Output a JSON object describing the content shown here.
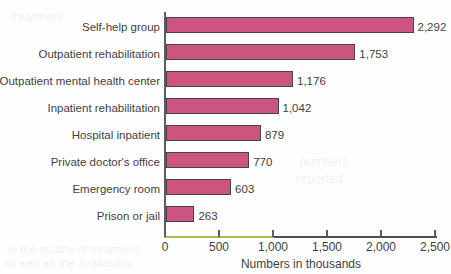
{
  "chart_data": {
    "type": "bar",
    "orientation": "horizontal",
    "title": "",
    "xlabel": "Numbers in thousands",
    "ylabel": "",
    "xlim": [
      0,
      2500
    ],
    "xticks": [
      "0",
      "500",
      "1,000",
      "1,500",
      "2,000",
      "2,500"
    ],
    "xtick_values": [
      0,
      500,
      1000,
      1500,
      2000,
      2500
    ],
    "grid": false,
    "legend": null,
    "categories": [
      "Self-help group",
      "Outpatient rehabilitation",
      "Outpatient mental health center",
      "Inpatient rehabilitation",
      "Hospital inpatient",
      "Private doctor's office",
      "Emergency room",
      "Prison or jail"
    ],
    "values": [
      2292,
      1753,
      1176,
      1042,
      879,
      770,
      603,
      263
    ],
    "value_labels": [
      "2,292",
      "1,753",
      "1,176",
      "1,042",
      "879",
      "770",
      "603",
      "263"
    ],
    "colors": {
      "bar_fill": "#cc5580",
      "bar_border": "#4a4246",
      "axis": "#5b5b66",
      "axis_tint": "#9cbf52",
      "text": "#3f3f3f",
      "background": "#ffffff"
    }
  },
  "artifacts": {
    "ghost_text_1": "in the quality of treatment",
    "ghost_text_2": "as well as the availability",
    "ghost_text_3": "numbers",
    "ghost_text_4": "reported",
    "ghost_text_5": "treatment"
  }
}
